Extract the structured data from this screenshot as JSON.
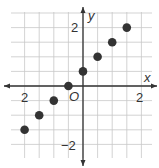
{
  "chart_data": {
    "type": "scatter",
    "title": "",
    "xlabel": "x",
    "ylabel": "y",
    "origin_label": "O",
    "x_tick_labels": [
      {
        "value": -2,
        "text": "2"
      },
      {
        "value": 2,
        "text": "2"
      }
    ],
    "y_tick_labels": [
      {
        "value": 2,
        "text": "2"
      },
      {
        "value": -2,
        "text": "−2"
      }
    ],
    "xlim": [
      -2.75,
      2.5
    ],
    "ylim": [
      -2.5,
      2.5
    ],
    "grid": true,
    "grid_step": 0.5,
    "points": [
      {
        "x": -2,
        "y": -1.5
      },
      {
        "x": -1.5,
        "y": -1
      },
      {
        "x": -1,
        "y": -0.5
      },
      {
        "x": -0.5,
        "y": 0
      },
      {
        "x": 0,
        "y": 0.5
      },
      {
        "x": 0.5,
        "y": 1
      },
      {
        "x": 1,
        "y": 1.5
      },
      {
        "x": 1.5,
        "y": 2
      }
    ],
    "colors": {
      "grid": "#c8c8c8",
      "axis": "#333333",
      "point": "#333333"
    }
  }
}
